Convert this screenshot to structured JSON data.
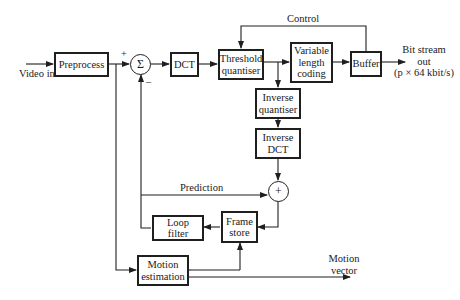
{
  "diagram": {
    "blocks": {
      "preprocess": "Preprocess",
      "dct": "DCT",
      "threshold_quantiser": [
        "Threshold",
        "quantiser"
      ],
      "vlc": [
        "Variable",
        "length",
        "coding"
      ],
      "buffer": "Buffer",
      "inverse_quantiser": [
        "Inverse",
        "quantiser"
      ],
      "inverse_dct": [
        "Inverse",
        "DCT"
      ],
      "loop_filter": [
        "Loop",
        "filter"
      ],
      "frame_store": [
        "Frame",
        "store"
      ],
      "motion_estimation": [
        "Motion",
        "estimation"
      ]
    },
    "nodes": {
      "subtractor": "Σ",
      "subtractor_plus": "+",
      "subtractor_minus": "–",
      "adder": "+"
    },
    "labels": {
      "video_in": "Video in",
      "control": "Control",
      "bitstream": [
        "Bit stream",
        "out",
        "(p × 64 kbit/s)"
      ],
      "prediction": "Prediction",
      "motion_vector": [
        "Motion",
        "vector"
      ]
    }
  }
}
